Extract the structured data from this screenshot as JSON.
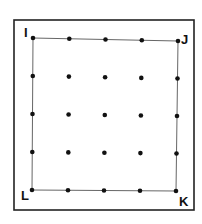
{
  "diagram": {
    "outer_frame": {
      "x1": 14,
      "y1": 20,
      "x2": 194,
      "y2": 210
    },
    "corners": [
      {
        "label": "I",
        "x": 33,
        "y": 38,
        "label_x": 24,
        "label_y": 26
      },
      {
        "label": "J",
        "x": 178,
        "y": 41,
        "label_x": 181,
        "label_y": 33
      },
      {
        "label": "K",
        "x": 176,
        "y": 191,
        "label_x": 179,
        "label_y": 195
      },
      {
        "label": "L",
        "x": 32,
        "y": 190,
        "label_x": 21,
        "label_y": 189
      }
    ],
    "grid": {
      "rows": 5,
      "cols": 5
    },
    "dot_color": "#111111",
    "line_color": "#555555"
  }
}
